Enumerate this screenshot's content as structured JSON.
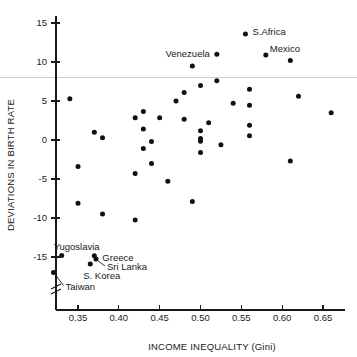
{
  "chart_data": {
    "type": "scatter",
    "title": "",
    "xlabel": "INCOME INEQUALITY (Gini)",
    "ylabel": "DEVIATIONS IN BIRTH RATE",
    "xlim": [
      0.315,
      0.672
    ],
    "ylim": [
      -17.8,
      16.2
    ],
    "xticks": [
      0.35,
      0.4,
      0.45,
      0.5,
      0.55,
      0.6,
      0.65
    ],
    "xticklabels": [
      "0.35",
      "0.40",
      "0.45",
      "0.50",
      "0.55",
      "0.60",
      "0.65"
    ],
    "yticks": [
      15,
      10,
      5,
      0,
      -5,
      -10,
      -15
    ],
    "yticklabels": [
      "15",
      "10",
      "5",
      "0",
      "-5",
      "-10",
      "-15"
    ],
    "grid": false,
    "legend": null,
    "axis_break_y": true,
    "reference_line": {
      "y": 8.05,
      "color": "#c9c9c9"
    },
    "points": [
      {
        "x": 0.32,
        "y": -17.0
      },
      {
        "x": 0.33,
        "y": -14.8
      },
      {
        "x": 0.34,
        "y": 5.3
      },
      {
        "x": 0.35,
        "y": -3.4
      },
      {
        "x": 0.35,
        "y": -8.1
      },
      {
        "x": 0.365,
        "y": -15.9
      },
      {
        "x": 0.37,
        "y": 1.0
      },
      {
        "x": 0.37,
        "y": -14.85
      },
      {
        "x": 0.372,
        "y": -15.25
      },
      {
        "x": 0.38,
        "y": 0.3
      },
      {
        "x": 0.38,
        "y": -9.5
      },
      {
        "x": 0.42,
        "y": 2.85
      },
      {
        "x": 0.42,
        "y": -4.3
      },
      {
        "x": 0.42,
        "y": -10.25
      },
      {
        "x": 0.43,
        "y": 3.65
      },
      {
        "x": 0.43,
        "y": 1.4
      },
      {
        "x": 0.43,
        "y": -1.1
      },
      {
        "x": 0.44,
        "y": -0.2
      },
      {
        "x": 0.44,
        "y": -3.0
      },
      {
        "x": 0.45,
        "y": 2.85
      },
      {
        "x": 0.46,
        "y": -5.3
      },
      {
        "x": 0.47,
        "y": 5.0
      },
      {
        "x": 0.48,
        "y": 6.1
      },
      {
        "x": 0.48,
        "y": 2.65
      },
      {
        "x": 0.49,
        "y": 9.5
      },
      {
        "x": 0.49,
        "y": -7.9
      },
      {
        "x": 0.5,
        "y": 7.0
      },
      {
        "x": 0.5,
        "y": 1.2
      },
      {
        "x": 0.5,
        "y": 0.2
      },
      {
        "x": 0.5,
        "y": -0.15
      },
      {
        "x": 0.5,
        "y": -1.6
      },
      {
        "x": 0.51,
        "y": 2.2
      },
      {
        "x": 0.52,
        "y": 11.0
      },
      {
        "x": 0.52,
        "y": 7.6
      },
      {
        "x": 0.525,
        "y": -0.6
      },
      {
        "x": 0.54,
        "y": 4.7
      },
      {
        "x": 0.555,
        "y": 13.6
      },
      {
        "x": 0.56,
        "y": 6.5
      },
      {
        "x": 0.56,
        "y": 4.45
      },
      {
        "x": 0.56,
        "y": 1.9
      },
      {
        "x": 0.56,
        "y": 0.55
      },
      {
        "x": 0.58,
        "y": 10.9
      },
      {
        "x": 0.61,
        "y": 10.2
      },
      {
        "x": 0.61,
        "y": -2.7
      },
      {
        "x": 0.62,
        "y": 5.6
      },
      {
        "x": 0.66,
        "y": 3.5
      }
    ],
    "annotations": [
      {
        "text": "S.Africa",
        "x": 0.555,
        "y": 13.6,
        "align": "start",
        "dx": 7,
        "dy": -2,
        "leader": false
      },
      {
        "text": "Venezuela",
        "x": 0.52,
        "y": 11.0,
        "align": "end",
        "dx": -7,
        "dy": 0,
        "leader": false
      },
      {
        "text": "Mexico",
        "x": 0.58,
        "y": 10.9,
        "align": "start",
        "dx": 4,
        "dy": -6,
        "leader": false
      },
      {
        "text": "Yugoslavia",
        "x": 0.33,
        "y": -14.8,
        "align": "start",
        "dx": -8,
        "dy": -8,
        "leader": false
      },
      {
        "text": "Greece",
        "x": 0.37,
        "y": -14.85,
        "align": "start",
        "dx": 8,
        "dy": 2,
        "leader": false
      },
      {
        "text": "Sri Lanka",
        "x": 0.372,
        "y": -15.25,
        "align": "start",
        "dx": 11,
        "dy": 8,
        "leader": true
      },
      {
        "text": "S. Korea",
        "x": 0.365,
        "y": -15.9,
        "align": "start",
        "dx": -7,
        "dy": 12,
        "leader": false
      },
      {
        "text": "Taiwan",
        "x": 0.32,
        "y": -17.0,
        "align": "start",
        "dx": 12,
        "dy": 14,
        "leader": true
      }
    ]
  },
  "figure": {
    "xlabel": "INCOME INEQUALITY (Gini)",
    "ylabel": "DEVIATIONS IN BIRTH RATE"
  }
}
